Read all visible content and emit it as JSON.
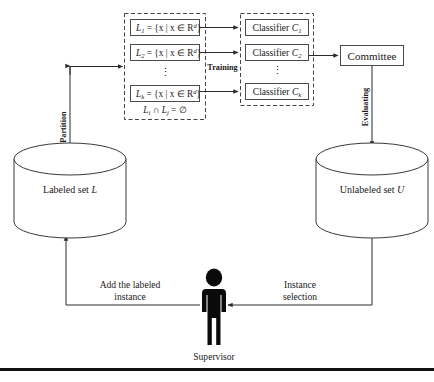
{
  "diagram": {
    "partition_group": {
      "label": "partition-sets-group",
      "sets": [
        {
          "name": "L",
          "index": "1",
          "definition": "= {x | x ∈ R",
          "exponent": "d",
          "close": "}"
        },
        {
          "name": "L",
          "index": "2",
          "definition": "= {x | x ∈ R",
          "exponent": "d",
          "close": "}"
        },
        {
          "name": "L",
          "index": "k",
          "definition": "= {x | x ∈ R",
          "exponent": "d",
          "close": "}"
        }
      ],
      "vertical_dots": "⋮",
      "constraint": {
        "left": "L",
        "left_sub": "i",
        "op": "∩",
        "right": "L",
        "right_sub": "j",
        "equals": "= ∅"
      }
    },
    "classifier_group": {
      "label": "classifier-group",
      "classifiers": [
        {
          "text": "Classifier",
          "symbol": "C",
          "index": "1"
        },
        {
          "text": "Classifier",
          "symbol": "C",
          "index": "2"
        },
        {
          "text": "Classifier",
          "symbol": "C",
          "index": "k"
        }
      ],
      "vertical_dots": "⋮"
    },
    "committee": {
      "label": "Committee"
    },
    "edge_labels": {
      "training": "Training",
      "partition": "Partition",
      "evaluating": "Evaluating",
      "add_labeled_instance_line1": "Add the labeled",
      "add_labeled_instance_line2": "instance",
      "instance_selection_line1": "Instance",
      "instance_selection_line2": "selection"
    },
    "stores": [
      {
        "name": "labeled-set-cylinder",
        "text": "Labeled set",
        "symbol": "L"
      },
      {
        "name": "unlabeled-set-cylinder",
        "text": "Unlabeled set",
        "symbol": "U"
      }
    ],
    "actor": {
      "name": "supervisor-figure",
      "caption": "Supervisor"
    },
    "colors": {
      "stroke": "#2b2b2b",
      "dashed_stroke": "#444444",
      "box_stroke": "#4a4a4a",
      "text": "#1a1a1a",
      "figure": "#0a0a0a",
      "background": "#ffffff"
    }
  }
}
